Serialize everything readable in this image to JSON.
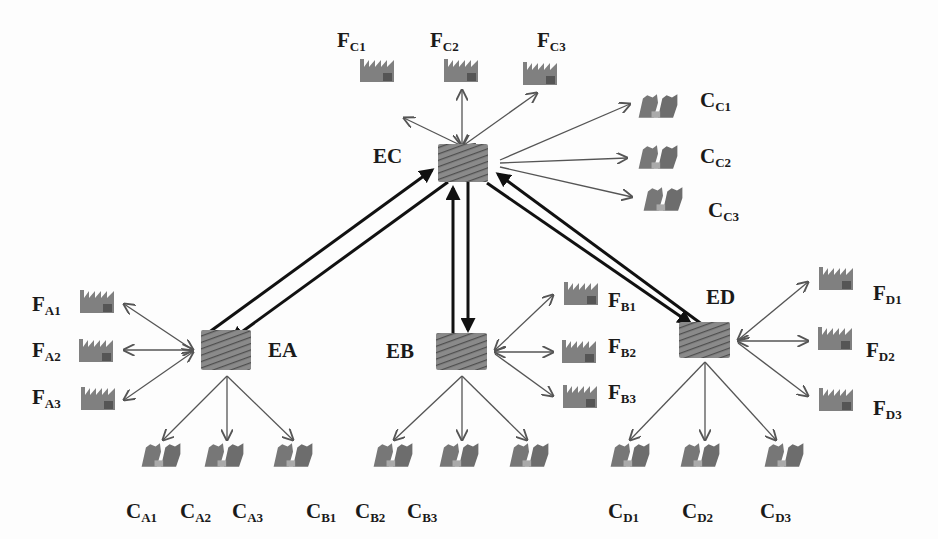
{
  "diagram": {
    "type": "network",
    "colors": {
      "line": "#555555",
      "thick_line": "#111111",
      "icon": "#7a7a7a",
      "icon_dark": "#555555",
      "text": "#1a1a1a",
      "background": "#fdfdfd"
    },
    "hubs": [
      {
        "id": "EC",
        "label": "EC",
        "x": 462,
        "y": 164
      },
      {
        "id": "EA",
        "label": "EA",
        "x": 230,
        "y": 350
      },
      {
        "id": "EB",
        "label": "EB",
        "x": 461,
        "y": 350
      },
      {
        "id": "ED",
        "label": "ED",
        "x": 707,
        "y": 340
      }
    ],
    "factories": [
      {
        "id": "FC1",
        "base": "F",
        "sub": "C1",
        "hub": "EC",
        "x": 399,
        "y": 74
      },
      {
        "id": "FC2",
        "base": "F",
        "sub": "C2",
        "hub": "EC",
        "x": 461,
        "y": 74
      },
      {
        "id": "FC3",
        "base": "F",
        "sub": "C3",
        "hub": "EC",
        "x": 541,
        "y": 74
      },
      {
        "id": "FA1",
        "base": "F",
        "sub": "A1",
        "hub": "EA",
        "x": 97,
        "y": 303
      },
      {
        "id": "FA2",
        "base": "F",
        "sub": "A2",
        "hub": "EA",
        "x": 97,
        "y": 350
      },
      {
        "id": "FA3",
        "base": "F",
        "sub": "A3",
        "hub": "EA",
        "x": 97,
        "y": 398
      },
      {
        "id": "FB1",
        "base": "F",
        "sub": "B1",
        "hub": "EB",
        "x": 579,
        "y": 293
      },
      {
        "id": "FB2",
        "base": "F",
        "sub": "B2",
        "hub": "EB",
        "x": 579,
        "y": 350
      },
      {
        "id": "FB3",
        "base": "F",
        "sub": "B3",
        "hub": "EB",
        "x": 579,
        "y": 395
      },
      {
        "id": "FD1",
        "base": "F",
        "sub": "D1",
        "hub": "ED",
        "x": 836,
        "y": 282
      },
      {
        "id": "FD2",
        "base": "F",
        "sub": "D2",
        "hub": "ED",
        "x": 836,
        "y": 339
      },
      {
        "id": "FD3",
        "base": "F",
        "sub": "D3",
        "hub": "ED",
        "x": 836,
        "y": 400
      }
    ],
    "clients": [
      {
        "id": "CC1",
        "base": "C",
        "sub": "C1",
        "hub": "EC",
        "x": 660,
        "y": 104
      },
      {
        "id": "CC2",
        "base": "C",
        "sub": "C2",
        "hub": "EC",
        "x": 660,
        "y": 157
      },
      {
        "id": "CC3",
        "base": "C",
        "sub": "C3",
        "hub": "EC",
        "x": 663,
        "y": 198
      },
      {
        "id": "CA1",
        "base": "C",
        "sub": "A1",
        "hub": "EA",
        "x": 161,
        "y": 456
      },
      {
        "id": "CA2",
        "base": "C",
        "sub": "A2",
        "hub": "EA",
        "x": 223,
        "y": 456
      },
      {
        "id": "CA3",
        "base": "C",
        "sub": "A3",
        "hub": "EA",
        "x": 290,
        "y": 456
      },
      {
        "id": "CB1",
        "base": "C",
        "sub": "B1",
        "hub": "EB",
        "x": 392,
        "y": 456
      },
      {
        "id": "CB2",
        "base": "C",
        "sub": "B2",
        "hub": "EB",
        "x": 456,
        "y": 456
      },
      {
        "id": "CB3",
        "base": "C",
        "sub": "B3",
        "hub": "EB",
        "x": 526,
        "y": 456
      },
      {
        "id": "CD1",
        "base": "C",
        "sub": "D1",
        "hub": "ED",
        "x": 626,
        "y": 456
      },
      {
        "id": "CD2",
        "base": "C",
        "sub": "D2",
        "hub": "ED",
        "x": 696,
        "y": 456
      },
      {
        "id": "CD3",
        "base": "C",
        "sub": "D3",
        "hub": "ED",
        "x": 778,
        "y": 456
      }
    ],
    "hub_links": [
      {
        "from": "EC",
        "to": "EA",
        "bidirectional": true
      },
      {
        "from": "EC",
        "to": "EB",
        "bidirectional": true
      },
      {
        "from": "EC",
        "to": "ED",
        "bidirectional": true
      }
    ],
    "labels": {
      "EC": {
        "text": "EC",
        "x": 373,
        "y": 150
      },
      "EA": {
        "text": "EA",
        "x": 269,
        "y": 340
      },
      "EB": {
        "text": "EB",
        "x": 386,
        "y": 341
      },
      "ED": {
        "text": "ED",
        "x": 706,
        "y": 286
      },
      "FC1": {
        "x": 333,
        "y": 32
      },
      "FC2": {
        "x": 430,
        "y": 32
      },
      "FC3": {
        "x": 537,
        "y": 32
      },
      "FA1": {
        "x": 32,
        "y": 294
      },
      "FA2": {
        "x": 32,
        "y": 342
      },
      "FA3": {
        "x": 32,
        "y": 387
      },
      "FB1": {
        "x": 608,
        "y": 291
      },
      "FB2": {
        "x": 608,
        "y": 337
      },
      "FB3": {
        "x": 608,
        "y": 384
      },
      "FD1": {
        "x": 873,
        "y": 285
      },
      "FD2": {
        "x": 866,
        "y": 342
      },
      "FD3": {
        "x": 873,
        "y": 400
      },
      "CC1": {
        "x": 700,
        "y": 91
      },
      "CC2": {
        "x": 700,
        "y": 146
      },
      "CC3": {
        "x": 708,
        "y": 200
      },
      "CA1": {
        "x": 125,
        "y": 502
      },
      "CA2": {
        "x": 180,
        "y": 502
      },
      "CA3": {
        "x": 232,
        "y": 502
      },
      "CB1": {
        "x": 306,
        "y": 502
      },
      "CB2": {
        "x": 355,
        "y": 502
      },
      "CB3": {
        "x": 407,
        "y": 502
      },
      "CD1": {
        "x": 482,
        "y": 502
      },
      "CD2": {
        "x": 535,
        "y": 502
      },
      "CD3": {
        "x": 583,
        "y": 502
      }
    }
  }
}
